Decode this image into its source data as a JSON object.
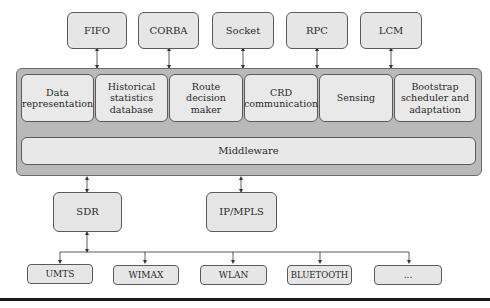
{
  "top_protocols": [
    {
      "label": "FIFO"
    },
    {
      "label": "CORBA"
    },
    {
      "label": "Socket"
    },
    {
      "label": "RPC"
    },
    {
      "label": "LCM"
    }
  ],
  "modules": [
    {
      "label": "Data representation"
    },
    {
      "label": "Historical statistics database"
    },
    {
      "label": "Route decision maker"
    },
    {
      "label": "CRD communication"
    },
    {
      "label": "Sensing"
    },
    {
      "label": "Bootstrap scheduler and adaptation"
    }
  ],
  "middleware": {
    "label": "Middleware"
  },
  "transport": [
    {
      "label": "SDR"
    },
    {
      "label": "IP/MPLS"
    }
  ],
  "radio_technologies": [
    {
      "label": "UMTS"
    },
    {
      "label": "WIMAX"
    },
    {
      "label": "WLAN"
    },
    {
      "label": "BLUETOOTH"
    },
    {
      "label": "..."
    }
  ],
  "colors": {
    "box_fill": "#e6e6e6",
    "container_fill": "#b9b9b9",
    "stroke": "#5a5a5a",
    "rule": "#1a1a1a"
  }
}
